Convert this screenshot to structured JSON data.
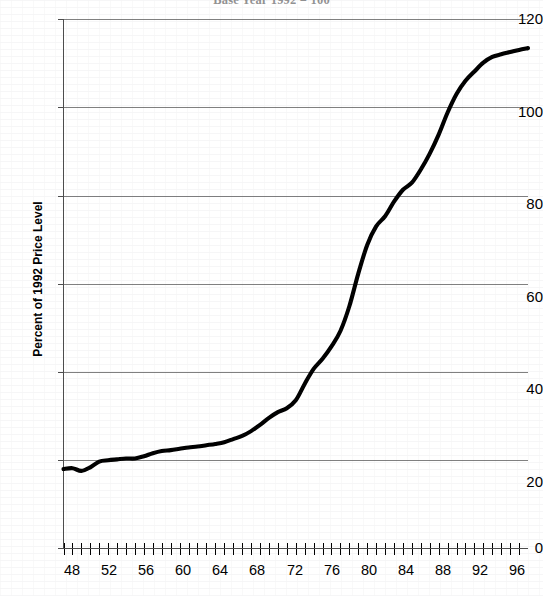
{
  "chart_data": {
    "type": "line",
    "title": "Base Year 1992 = 100",
    "xlabel": "",
    "ylabel": "Percent of 1992 Price Level",
    "xlim": [
      47,
      99
    ],
    "ylim": [
      0,
      120
    ],
    "grid": true,
    "legend": null,
    "series_name": "Price level index",
    "line_color": "#000000",
    "grid_color": "#808080",
    "y_ticks": [
      0,
      20,
      40,
      60,
      80,
      100,
      120
    ],
    "y_tick_labels": [
      "0",
      "20",
      "40",
      "60",
      "80",
      "100",
      "120"
    ],
    "x_ticks": [
      48,
      52,
      56,
      60,
      64,
      68,
      72,
      76,
      80,
      84,
      88,
      92,
      96
    ],
    "x_tick_labels": [
      "48",
      "52",
      "56",
      "60",
      "64",
      "68",
      "72",
      "76",
      "80",
      "84",
      "88",
      "92",
      "96"
    ],
    "x_minor_tick_interval": 1,
    "x": [
      47,
      48,
      49,
      50,
      51,
      52,
      53,
      54,
      55,
      56,
      57,
      58,
      59,
      60,
      61,
      62,
      63,
      64,
      65,
      66,
      67,
      68,
      69,
      70,
      71,
      72,
      73,
      74,
      75,
      76,
      77,
      78,
      79,
      80,
      81,
      82,
      83,
      84,
      85,
      86,
      87,
      88,
      89,
      90,
      91,
      92,
      93,
      94,
      95,
      96,
      97,
      98,
      99
    ],
    "values": [
      18.0,
      18.2,
      17.6,
      18.4,
      19.7,
      20.0,
      20.2,
      20.4,
      20.4,
      20.9,
      21.6,
      22.1,
      22.3,
      22.6,
      22.9,
      23.1,
      23.4,
      23.7,
      24.1,
      24.8,
      25.5,
      26.6,
      28.0,
      29.6,
      30.9,
      31.8,
      33.6,
      37.3,
      40.7,
      43.0,
      45.8,
      49.3,
      54.9,
      62.3,
      68.8,
      73.0,
      75.3,
      78.6,
      81.3,
      82.9,
      85.9,
      89.5,
      93.8,
      98.8,
      103.0,
      106.0,
      108.1,
      110.1,
      111.4,
      112.0,
      112.5,
      113.0,
      113.4
    ]
  }
}
